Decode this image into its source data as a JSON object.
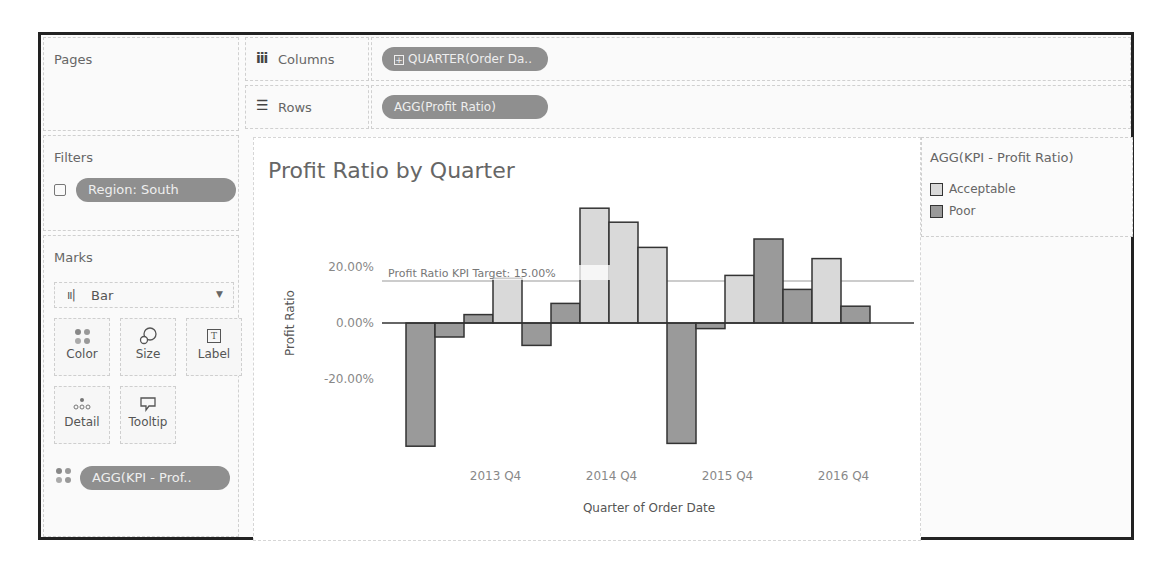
{
  "shelves": {
    "pages_label": "Pages",
    "columns": {
      "icon": "columns-icon",
      "label": "Columns",
      "pill": "QUARTER(Order Da..",
      "pill_icon": "plus-box-icon"
    },
    "rows": {
      "icon": "rows-icon",
      "label": "Rows",
      "pill": "AGG(Profit Ratio)"
    }
  },
  "filters": {
    "label": "Filters",
    "items": [
      {
        "icon": "filter-icon",
        "label": "Region: South"
      }
    ]
  },
  "marks": {
    "label": "Marks",
    "type": "Bar",
    "type_icon": "bar-chart-icon",
    "cards": [
      {
        "label": "Color",
        "icon": "color-icon"
      },
      {
        "label": "Size",
        "icon": "size-icon"
      },
      {
        "label": "Label",
        "icon": "label-icon"
      },
      {
        "label": "Detail",
        "icon": "detail-icon"
      },
      {
        "label": "Tooltip",
        "icon": "tooltip-icon"
      }
    ],
    "fields": [
      {
        "icon": "color-icon",
        "label": "AGG(KPI - Prof.."
      }
    ]
  },
  "legend": {
    "title": "AGG(KPI - Profit Ratio)",
    "items": [
      {
        "label": "Acceptable",
        "color": "#d9d9d9"
      },
      {
        "label": "Poor",
        "color": "#9a9a9a"
      }
    ]
  },
  "chart_data": {
    "type": "bar",
    "title": "Profit Ratio by Quarter",
    "xlabel": "Quarter of Order Date",
    "ylabel": "Profit Ratio",
    "ylim": [
      -46,
      44
    ],
    "y_ticks": [
      "20.00%",
      "0.00%",
      "-20.00%"
    ],
    "x_tick_labels": [
      "2013 Q4",
      "2014 Q4",
      "2015 Q4",
      "2016 Q4"
    ],
    "reference_line": {
      "label": "Profit Ratio KPI Target: 15.00%",
      "value": 15
    },
    "categories": [
      "2013 Q1",
      "2013 Q2",
      "2013 Q3",
      "2013 Q4",
      "2014 Q1",
      "2014 Q2",
      "2014 Q3",
      "2014 Q4",
      "2015 Q1",
      "2015 Q2",
      "2015 Q3",
      "2015 Q4",
      "2016 Q1",
      "2016 Q2",
      "2016 Q3",
      "2016 Q4"
    ],
    "values": [
      -44,
      -5,
      3,
      16,
      -8,
      7,
      41,
      36,
      27,
      -43,
      -2,
      17,
      30,
      12,
      23,
      6
    ],
    "kpi": [
      "Poor",
      "Poor",
      "Poor",
      "Acceptable",
      "Poor",
      "Poor",
      "Acceptable",
      "Acceptable",
      "Acceptable",
      "Poor",
      "Poor",
      "Acceptable",
      "Poor",
      "Poor",
      "Acceptable",
      "Poor"
    ],
    "colors": {
      "Acceptable": "#d9d9d9",
      "Poor": "#9a9a9a"
    },
    "grid": false,
    "legend_position": "right"
  }
}
